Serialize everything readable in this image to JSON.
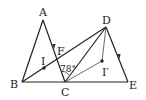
{
  "diagram": {
    "type": "geometry",
    "points": {
      "A": {
        "label": "A",
        "x": 43,
        "y": 20
      },
      "B": {
        "label": "B",
        "x": 22,
        "y": 82
      },
      "C": {
        "label": "C",
        "x": 65,
        "y": 82
      },
      "D": {
        "label": "D",
        "x": 106,
        "y": 27
      },
      "E": {
        "label": "E",
        "x": 128,
        "y": 82
      },
      "F": {
        "label": "F",
        "x": 55,
        "y": 53
      },
      "I": {
        "label": "I",
        "x": 44,
        "y": 68
      },
      "I_prime": {
        "label": "I′",
        "x": 102,
        "y": 61
      }
    },
    "angle_label": "78°",
    "segments": [
      "AB",
      "AC",
      "BC",
      "CE",
      "BD",
      "CD",
      "DE",
      "DI′",
      "CI′"
    ],
    "arrow_marks": [
      "AC",
      "DE"
    ]
  }
}
